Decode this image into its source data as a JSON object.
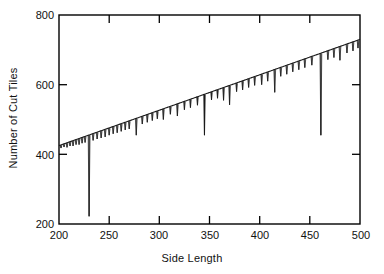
{
  "chart_data": {
    "type": "line",
    "title": "",
    "xlabel": "Side Length",
    "ylabel": "Number of Cut Tiles",
    "xlim": [
      200,
      500
    ],
    "ylim": [
      200,
      800
    ],
    "xticks": [
      200,
      250,
      300,
      350,
      400,
      450,
      500
    ],
    "yticks": [
      200,
      400,
      600,
      800
    ],
    "grid": false,
    "legend": null,
    "series": [
      {
        "name": "Number of Cut Tiles",
        "description": "Near-linear envelope rising from about 425 cut tiles at side length 200 to about 730 at side length 500, interrupted by sharp downward spikes at side lengths where the tiling aligns.",
        "envelope": {
          "x_start": 200,
          "y_start": 425,
          "x_end": 500,
          "y_end": 730,
          "slope": 1.0167
        },
        "spikes": [
          {
            "x": 202,
            "depth": 418
          },
          {
            "x": 205,
            "depth": 421
          },
          {
            "x": 208,
            "depth": 420
          },
          {
            "x": 211,
            "depth": 424
          },
          {
            "x": 214,
            "depth": 424
          },
          {
            "x": 217,
            "depth": 428
          },
          {
            "x": 220,
            "depth": 428
          },
          {
            "x": 223,
            "depth": 432
          },
          {
            "x": 226,
            "depth": 434
          },
          {
            "x": 230,
            "depth": 222
          },
          {
            "x": 234,
            "depth": 440
          },
          {
            "x": 238,
            "depth": 444
          },
          {
            "x": 242,
            "depth": 447
          },
          {
            "x": 246,
            "depth": 450
          },
          {
            "x": 250,
            "depth": 455
          },
          {
            "x": 254,
            "depth": 459
          },
          {
            "x": 258,
            "depth": 462
          },
          {
            "x": 262,
            "depth": 466
          },
          {
            "x": 266,
            "depth": 470
          },
          {
            "x": 270,
            "depth": 473
          },
          {
            "x": 277,
            "depth": 455
          },
          {
            "x": 283,
            "depth": 487
          },
          {
            "x": 288,
            "depth": 492
          },
          {
            "x": 293,
            "depth": 497
          },
          {
            "x": 298,
            "depth": 502
          },
          {
            "x": 304,
            "depth": 500
          },
          {
            "x": 311,
            "depth": 515
          },
          {
            "x": 318,
            "depth": 510
          },
          {
            "x": 325,
            "depth": 528
          },
          {
            "x": 331,
            "depth": 534
          },
          {
            "x": 338,
            "depth": 541
          },
          {
            "x": 345,
            "depth": 455
          },
          {
            "x": 352,
            "depth": 556
          },
          {
            "x": 358,
            "depth": 561
          },
          {
            "x": 364,
            "depth": 555
          },
          {
            "x": 370,
            "depth": 542
          },
          {
            "x": 377,
            "depth": 580
          },
          {
            "x": 383,
            "depth": 585
          },
          {
            "x": 389,
            "depth": 592
          },
          {
            "x": 395,
            "depth": 598
          },
          {
            "x": 402,
            "depth": 600
          },
          {
            "x": 408,
            "depth": 610
          },
          {
            "x": 415,
            "depth": 578
          },
          {
            "x": 421,
            "depth": 624
          },
          {
            "x": 427,
            "depth": 630
          },
          {
            "x": 433,
            "depth": 637
          },
          {
            "x": 439,
            "depth": 643
          },
          {
            "x": 445,
            "depth": 649
          },
          {
            "x": 452,
            "depth": 656
          },
          {
            "x": 461,
            "depth": 455
          },
          {
            "x": 468,
            "depth": 672
          },
          {
            "x": 474,
            "depth": 678
          },
          {
            "x": 480,
            "depth": 670
          },
          {
            "x": 487,
            "depth": 691
          },
          {
            "x": 493,
            "depth": 697
          },
          {
            "x": 498,
            "depth": 705
          }
        ]
      }
    ]
  },
  "axes": {
    "xlabel": "Side Length",
    "ylabel": "Number of Cut Tiles",
    "xtick_labels": [
      "200",
      "250",
      "300",
      "350",
      "400",
      "450",
      "500"
    ],
    "ytick_labels": [
      "800",
      "600",
      "400",
      "200"
    ]
  },
  "colors": {
    "line": "#1a1a1a",
    "axis": "#000000",
    "background": "#ffffff",
    "text": "#111111"
  }
}
